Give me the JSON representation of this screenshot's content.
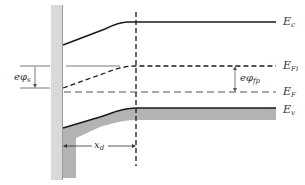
{
  "diagram": {
    "type": "energy-band-diagram",
    "colors": {
      "line": "#1a1a1a",
      "thin_line": "#555555",
      "shade": "#b3b3b3",
      "oxide": "#d9d9d9",
      "text": "#333333"
    },
    "labels": {
      "ec": {
        "main": "E",
        "sub": "c"
      },
      "efi": {
        "main": "E",
        "sub": "Fi"
      },
      "ef": {
        "main": "E",
        "sub": "F"
      },
      "ev": {
        "main": "E",
        "sub": "v"
      },
      "ephi_s": {
        "main": "eφ",
        "sub": "s"
      },
      "ephi_fp": {
        "main": "eφ",
        "sub": "fp"
      },
      "xd": {
        "main": "x",
        "sub": "d"
      }
    },
    "levels": [
      {
        "name": "Conduction band edge",
        "id": "Ec",
        "style": "solid",
        "bulk_y": 22
      },
      {
        "name": "Intrinsic Fermi level",
        "id": "EFi",
        "style": "dashed",
        "bulk_y": 66
      },
      {
        "name": "Fermi level",
        "id": "EF",
        "style": "dashed",
        "bulk_y": 92
      },
      {
        "name": "Valence band edge",
        "id": "Ev",
        "style": "solid",
        "bulk_y": 108
      }
    ],
    "annotations": [
      {
        "id": "ephi_s",
        "description": "surface potential energy, arrow between bulk EFi and surface EFi"
      },
      {
        "id": "ephi_fp",
        "description": "arrow between EFi and EF in bulk"
      },
      {
        "id": "xd",
        "description": "depletion width, double arrow from surface to depletion edge"
      }
    ]
  }
}
